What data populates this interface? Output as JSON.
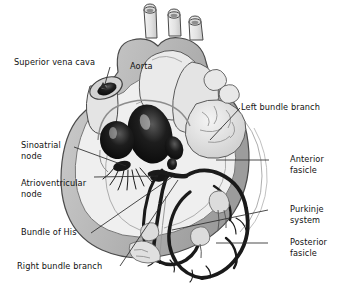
{
  "figure": {
    "background_color": "#ffffff",
    "text_color": "#111111",
    "wall_color": "#b9b9b9",
    "chamber_fill": "#efefef",
    "cavity_color": "#141414",
    "conduction_color": "#1a1a1a",
    "outline_color": "#4a4a4a"
  },
  "labels": {
    "superior_vena_cava": "Superior vena cava",
    "aorta": "Aorta",
    "sinoatrial_node_l1": "Sinoatrial",
    "sinoatrial_node_l2": "node",
    "atrioventricular_node_l1": "Atrioventricular",
    "atrioventricular_node_l2": "node",
    "bundle_of_his": "Bundle of His",
    "right_bundle_branch": "Right bundle branch",
    "left_bundle_branch": "Left bundle branch",
    "anterior_fasicle_l1": "Anterior",
    "anterior_fasicle_l2": "fasicle",
    "purkinje_system_l1": "Purkinje",
    "purkinje_system_l2": "system",
    "posterior_fasicle_l1": "Posterior",
    "posterior_fasicle_l2": "fasicle"
  }
}
